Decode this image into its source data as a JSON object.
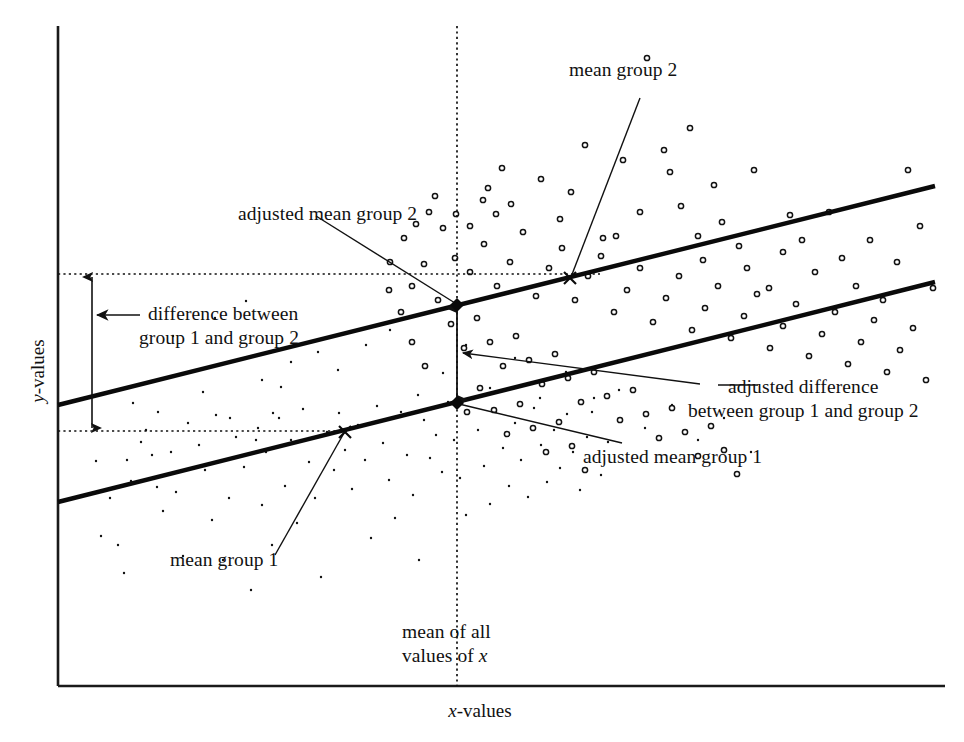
{
  "figure": {
    "kind": "ancova-scatter-diagram",
    "background": "#ffffff",
    "ink": "#111111"
  },
  "axes": {
    "x_label_prefix": "x",
    "x_label_suffix": "-values",
    "y_label_prefix": "y",
    "y_label_suffix": "-values",
    "x_axis_color": "#1a1a1a",
    "y_axis_color": "#1a1a1a"
  },
  "annotations": {
    "mean_group_2": "mean group 2",
    "adjusted_mean_group_2": "adjusted mean group 2",
    "difference_line1": "difference between",
    "difference_line2": "group 1 and group 2",
    "adjusted_difference_line1": "adjusted difference",
    "adjusted_difference_line2": "between group 1 and group 2",
    "adjusted_mean_group_1": "adjusted mean group 1",
    "mean_group_1": "mean group 1",
    "mean_of_all_x_line1": "mean of all",
    "mean_of_all_x_line2_prefix": "values of ",
    "mean_of_all_x_line2_italic": "x"
  },
  "chart_data": {
    "type": "scatter",
    "title": "",
    "xlabel": "x-values",
    "ylabel": "y-values",
    "grid": false,
    "legend": "none",
    "xlim": [
      0,
      100
    ],
    "ylim": [
      0,
      100
    ],
    "plot_box_px": {
      "left": 58,
      "right": 945,
      "top": 26,
      "bottom": 686
    },
    "series": [
      {
        "name": "group 1",
        "marker": "small-filled-dot",
        "marker_size_px": 2.4,
        "color": "#111111",
        "points_px": [
          [
            96,
            461
          ],
          [
            101,
            536
          ],
          [
            118,
            545
          ],
          [
            124,
            573
          ],
          [
            131,
            481
          ],
          [
            141,
            442
          ],
          [
            157,
            487
          ],
          [
            163,
            511
          ],
          [
            152,
            455
          ],
          [
            171,
            452
          ],
          [
            176,
            492
          ],
          [
            183,
            556
          ],
          [
            188,
            423
          ],
          [
            199,
            445
          ],
          [
            205,
            470
          ],
          [
            212,
            520
          ],
          [
            216,
            415
          ],
          [
            223,
            560
          ],
          [
            229,
            498
          ],
          [
            236,
            437
          ],
          [
            244,
            467
          ],
          [
            251,
            590
          ],
          [
            258,
            428
          ],
          [
            262,
            505
          ],
          [
            266,
            452
          ],
          [
            272,
            545
          ],
          [
            279,
            418
          ],
          [
            285,
            486
          ],
          [
            291,
            440
          ],
          [
            297,
            523
          ],
          [
            303,
            409
          ],
          [
            309,
            462
          ],
          [
            315,
            498
          ],
          [
            321,
            577
          ],
          [
            327,
            432
          ],
          [
            334,
            470
          ],
          [
            339,
            413
          ],
          [
            345,
            450
          ],
          [
            352,
            489
          ],
          [
            358,
            425
          ],
          [
            365,
            460
          ],
          [
            371,
            538
          ],
          [
            377,
            406
          ],
          [
            383,
            443
          ],
          [
            389,
            480
          ],
          [
            395,
            518
          ],
          [
            401,
            412
          ],
          [
            407,
            455
          ],
          [
            413,
            495
          ],
          [
            419,
            560
          ],
          [
            424,
            420
          ],
          [
            430,
            458
          ],
          [
            436,
            435
          ],
          [
            442,
            472
          ],
          [
            448,
            402
          ],
          [
            454,
            440
          ],
          [
            460,
            478
          ],
          [
            466,
            515
          ],
          [
            472,
            398
          ],
          [
            478,
            430
          ],
          [
            484,
            466
          ],
          [
            490,
            504
          ],
          [
            496,
            412
          ],
          [
            503,
            448
          ],
          [
            509,
            486
          ],
          [
            515,
            423
          ],
          [
            521,
            460
          ],
          [
            528,
            497
          ],
          [
            534,
            408
          ],
          [
            541,
            445
          ],
          [
            547,
            482
          ],
          [
            554,
            430
          ],
          [
            560,
            468
          ],
          [
            567,
            414
          ],
          [
            573,
            452
          ],
          [
            580,
            490
          ],
          [
            587,
            437
          ],
          [
            594,
            398
          ],
          [
            601,
            475
          ],
          [
            608,
            442
          ],
          [
            345,
            432
          ],
          [
            262,
            380
          ],
          [
            291,
            362
          ],
          [
            318,
            352
          ],
          [
            173,
            336
          ],
          [
            215,
            318
          ],
          [
            246,
            301
          ],
          [
            281,
            387
          ],
          [
            203,
            392
          ],
          [
            133,
            403
          ],
          [
            338,
            370
          ],
          [
            366,
            345
          ],
          [
            390,
            330
          ],
          [
            418,
            395
          ],
          [
            443,
            373
          ],
          [
            158,
            412
          ],
          [
            466,
            345
          ],
          [
            490,
            388
          ],
          [
            515,
            358
          ],
          [
            540,
            398
          ],
          [
            566,
            372
          ],
          [
            592,
            412
          ],
          [
            619,
            390
          ],
          [
            645,
            428
          ],
          [
            672,
            405
          ],
          [
            698,
            440
          ],
          [
            724,
            418
          ],
          [
            751,
            452
          ],
          [
            110,
            498
          ],
          [
            127,
            460
          ],
          [
            146,
            430
          ],
          [
            230,
            418
          ],
          [
            256,
            440
          ],
          [
            273,
            413
          ]
        ]
      },
      {
        "name": "group 2",
        "marker": "open-circle",
        "marker_size_px": 5.2,
        "color": "#111111",
        "points_px": [
          [
            435,
            196
          ],
          [
            488,
            188
          ],
          [
            502,
            168
          ],
          [
            541,
            179
          ],
          [
            560,
            219
          ],
          [
            571,
            192
          ],
          [
            585,
            145
          ],
          [
            603,
            238
          ],
          [
            616,
            236
          ],
          [
            623,
            160
          ],
          [
            640,
            212
          ],
          [
            647,
            58
          ],
          [
            664,
            150
          ],
          [
            670,
            172
          ],
          [
            681,
            206
          ],
          [
            690,
            128
          ],
          [
            698,
            236
          ],
          [
            703,
            260
          ],
          [
            714,
            185
          ],
          [
            722,
            222
          ],
          [
            739,
            246
          ],
          [
            747,
            268
          ],
          [
            754,
            170
          ],
          [
            769,
            288
          ],
          [
            783,
            252
          ],
          [
            790,
            215
          ],
          [
            802,
            240
          ],
          [
            815,
            272
          ],
          [
            829,
            212
          ],
          [
            842,
            258
          ],
          [
            856,
            286
          ],
          [
            870,
            240
          ],
          [
            883,
            300
          ],
          [
            897,
            262
          ],
          [
            908,
            170
          ],
          [
            920,
            226
          ],
          [
            933,
            288
          ],
          [
            455,
            258
          ],
          [
            470,
            272
          ],
          [
            484,
            244
          ],
          [
            497,
            286
          ],
          [
            510,
            262
          ],
          [
            523,
            232
          ],
          [
            536,
            296
          ],
          [
            549,
            268
          ],
          [
            562,
            248
          ],
          [
            575,
            300
          ],
          [
            588,
            276
          ],
          [
            601,
            256
          ],
          [
            614,
            312
          ],
          [
            627,
            290
          ],
          [
            640,
            268
          ],
          [
            653,
            322
          ],
          [
            666,
            298
          ],
          [
            679,
            276
          ],
          [
            692,
            330
          ],
          [
            705,
            308
          ],
          [
            718,
            286
          ],
          [
            731,
            338
          ],
          [
            744,
            316
          ],
          [
            757,
            294
          ],
          [
            770,
            348
          ],
          [
            783,
            326
          ],
          [
            796,
            304
          ],
          [
            809,
            356
          ],
          [
            822,
            334
          ],
          [
            835,
            312
          ],
          [
            848,
            364
          ],
          [
            861,
            342
          ],
          [
            874,
            320
          ],
          [
            887,
            372
          ],
          [
            900,
            350
          ],
          [
            913,
            328
          ],
          [
            926,
            380
          ],
          [
            438,
            300
          ],
          [
            451,
            324
          ],
          [
            464,
            348
          ],
          [
            477,
            318
          ],
          [
            490,
            342
          ],
          [
            503,
            366
          ],
          [
            516,
            336
          ],
          [
            529,
            360
          ],
          [
            542,
            384
          ],
          [
            555,
            354
          ],
          [
            568,
            378
          ],
          [
            581,
            402
          ],
          [
            594,
            372
          ],
          [
            607,
            396
          ],
          [
            620,
            420
          ],
          [
            633,
            390
          ],
          [
            646,
            414
          ],
          [
            659,
            438
          ],
          [
            672,
            408
          ],
          [
            685,
            432
          ],
          [
            698,
            456
          ],
          [
            711,
            426
          ],
          [
            724,
            450
          ],
          [
            737,
            474
          ],
          [
            494,
            410
          ],
          [
            507,
            434
          ],
          [
            520,
            404
          ],
          [
            533,
            428
          ],
          [
            546,
            452
          ],
          [
            559,
            422
          ],
          [
            572,
            446
          ],
          [
            585,
            470
          ],
          [
            480,
            388
          ],
          [
            467,
            412
          ],
          [
            412,
            286
          ],
          [
            424,
            264
          ],
          [
            401,
            312
          ],
          [
            389,
            290
          ],
          [
            412,
            342
          ],
          [
            425,
            366
          ],
          [
            390,
            262
          ],
          [
            404,
            238
          ],
          [
            416,
            224
          ],
          [
            429,
            212
          ],
          [
            443,
            228
          ],
          [
            456,
            214
          ],
          [
            470,
            226
          ],
          [
            483,
            200
          ],
          [
            496,
            214
          ],
          [
            511,
            204
          ]
        ]
      }
    ],
    "regression_lines": [
      {
        "name": "group 2 regression line",
        "from_px": [
          58,
          405
        ],
        "to_px": [
          935,
          186
        ],
        "width_px": 4.2,
        "color": "#0a0a0a"
      },
      {
        "name": "group 1 regression line",
        "from_px": [
          58,
          502
        ],
        "to_px": [
          935,
          282
        ],
        "width_px": 4.2,
        "color": "#0a0a0a"
      }
    ],
    "reference_lines": [
      {
        "name": "mean of all x vertical",
        "orientation": "vertical",
        "x_px": 457,
        "from_y_px": 26,
        "to_y_px": 686,
        "style": "dotted"
      },
      {
        "name": "adjusted mean group 2 horizontal",
        "orientation": "horizontal",
        "y_px": 274,
        "from_x_px": 58,
        "to_x_px": 600,
        "style": "dotted"
      },
      {
        "name": "mean group 1 horizontal",
        "orientation": "horizontal",
        "y_px": 431,
        "from_x_px": 58,
        "to_x_px": 348,
        "style": "dotted"
      }
    ],
    "markers": [
      {
        "name": "adjusted mean group 2 point",
        "x_px": 457,
        "y_px": 305,
        "glyph": "filled-diamond"
      },
      {
        "name": "adjusted mean group 1 point",
        "x_px": 457,
        "y_px": 403,
        "glyph": "filled-diamond"
      },
      {
        "name": "mean group 2 cross",
        "x_px": 570,
        "y_px": 278,
        "glyph": "x-cross"
      },
      {
        "name": "mean group 1 cross",
        "x_px": 345,
        "y_px": 432,
        "glyph": "x-cross"
      }
    ]
  }
}
